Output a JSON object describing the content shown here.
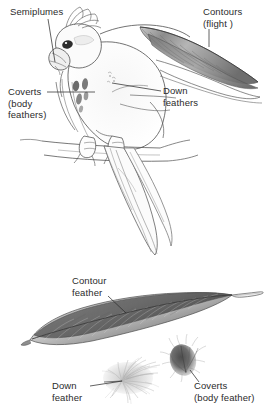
{
  "figure": {
    "background_color": "#ffffff",
    "ink_color": "#3a3a3a",
    "labels": [
      {
        "id": "semiplumes",
        "name": "label-semiplumes",
        "text": "Semiplumes",
        "x": 10,
        "y": 6,
        "leader": [
          [
            48,
            19
          ],
          [
            55,
            62
          ]
        ]
      },
      {
        "id": "contours_flight",
        "name": "label-contours-flight",
        "text": "Contours\n(flight )",
        "x": 203,
        "y": 6,
        "leader": [
          [
            209,
            29
          ],
          [
            209,
            47
          ]
        ]
      },
      {
        "id": "coverts_body",
        "name": "label-coverts-body-feathers",
        "text": "Coverts\n(body\nfeathers)",
        "x": 8,
        "y": 86,
        "leader": [
          [
            47,
            92
          ],
          [
            95,
            92
          ]
        ]
      },
      {
        "id": "down_feathers",
        "name": "label-down-feathers",
        "text": "Down\nfeathers",
        "x": 163,
        "y": 85,
        "leader": [
          [
            161,
            91
          ],
          [
            112,
            83
          ]
        ]
      },
      {
        "id": "contour_feather",
        "name": "label-contour-feather",
        "text": "Contour\nfeather",
        "x": 72,
        "y": 275,
        "leader": [
          [
            108,
            296
          ],
          [
            126,
            313
          ]
        ]
      },
      {
        "id": "down_feather_single",
        "name": "label-down-feather",
        "text": "Down\nfeather",
        "x": 52,
        "y": 380,
        "leader": [
          [
            90,
            386
          ],
          [
            122,
            381
          ]
        ]
      },
      {
        "id": "coverts_body_feather",
        "name": "label-coverts-body-feather",
        "text": "Coverts\n(body feather)",
        "x": 194,
        "y": 380,
        "leader": [
          [
            199,
            382
          ],
          [
            190,
            370
          ]
        ]
      }
    ],
    "specimens": {
      "bird": "perched-cockatoo-with-crest",
      "contour_feather": "large-shaded-contour-feather",
      "down_feather": "wispy-pale-down-tuft",
      "coverts_feather": "small-dark-fuzzy-covert-feather"
    }
  }
}
